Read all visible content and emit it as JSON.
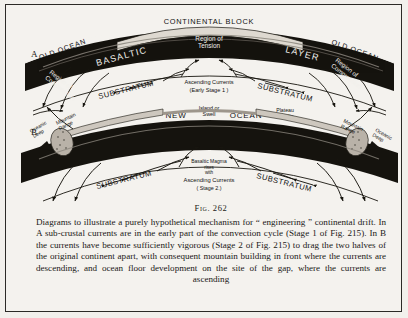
{
  "figure": {
    "number_label": "Fig. 262",
    "panels": [
      {
        "id": "A",
        "letter": "A",
        "labels": {
          "continental_block": "CONTINENTAL  BLOCK",
          "region_of_tension": "Region of",
          "region_of_tension2": "Tension",
          "basaltic": "BASALTIC",
          "layer": "LAYER",
          "old_ocean_left": "OLD OCEAN",
          "old_ocean_right": "OLD OCEAN",
          "region_of_compression_left": "Region of",
          "region_of_compression_left2": "Compression",
          "region_of_compression_right": "Region of",
          "region_of_compression_right2": "Compression",
          "substratum_left": "SUBSTRATUM",
          "substratum_right": "SUBSTRATUM",
          "ascending_currents": "Ascending Currents",
          "ascending_currents_stage": "(Early Stage 1 )"
        }
      },
      {
        "id": "B",
        "letter": "B",
        "labels": {
          "new": "NEW",
          "ocean": "OCEAN",
          "island_or_swell": "Island or",
          "island_or_swell2": "Swell",
          "plateau_basalts": "Plateau",
          "plateau_basalts2": "Basalts",
          "mountain_range_left": "Mountain",
          "mountain_range_left2": "Range",
          "mountain_range_right": "Mountain",
          "mountain_range_right2": "Range",
          "oceanic_deep_left": "Oceanic",
          "oceanic_deep_left2": "Deep",
          "oceanic_deep_right": "Oceanic",
          "oceanic_deep_right2": "Deep",
          "substratum_left": "SUBSTRATUM",
          "substratum_right": "SUBSTRATUM",
          "basaltic_magma": "Basaltic Magma",
          "basaltic_magma2": "rises",
          "basaltic_magma3": "with",
          "ascending_currents": "Ascending Currents",
          "ascending_currents_stage": "( Stage 2.)"
        }
      }
    ],
    "caption": "Diagrams to illustrate a purely hypothetical mechanism for “ engineering ” continental drift. In A sub-crustal currents are in the early part of the convection cycle (Stage 1 of Fig. 215). In B the currents have become sufficiently vigorous (Stage 2 of Fig. 215) to drag the two halves of the original continent apart, with consequent mountain building in front where the currents are descending, and ocean floor development on the site of the gap, where the currents are ascending"
  },
  "colors": {
    "page_background": "#f2f0ec",
    "ink": "#17150f",
    "crust_fill": "#15130e",
    "paper": "#f4f2ee"
  }
}
